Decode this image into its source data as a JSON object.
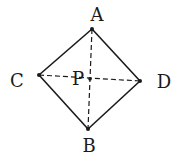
{
  "diagram": {
    "type": "geometry",
    "colors": {
      "stroke": "#1a1a1a",
      "background": "#ffffff"
    },
    "points": {
      "A": {
        "label": "A",
        "x": 92,
        "y": 29,
        "lx": 97,
        "ly": 21
      },
      "B": {
        "label": "B",
        "x": 88,
        "y": 129,
        "lx": 89,
        "ly": 152
      },
      "C": {
        "label": "C",
        "x": 39,
        "y": 75,
        "lx": 17,
        "ly": 87
      },
      "D": {
        "label": "D",
        "x": 140,
        "y": 81,
        "lx": 164,
        "ly": 88
      },
      "P": {
        "label": "P",
        "x": 90,
        "y": 79,
        "lx": 78,
        "ly": 85
      }
    },
    "solid_edges": [
      [
        "A",
        "C"
      ],
      [
        "C",
        "B"
      ],
      [
        "B",
        "D"
      ],
      [
        "D",
        "A"
      ]
    ],
    "dashed_edges": [
      [
        "A",
        "B"
      ],
      [
        "C",
        "D"
      ]
    ]
  }
}
